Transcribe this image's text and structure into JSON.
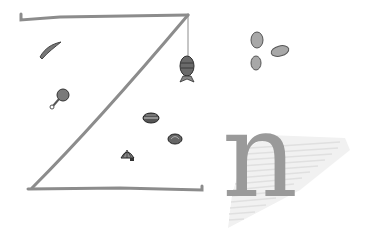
{
  "illustration": {
    "letters": [
      {
        "char": "Z",
        "style": "hand-drawn outline strokes",
        "color": "#8c8c8c"
      },
      {
        "char": "n",
        "style": "serif glyph with hatched shadow",
        "color": "#9a9a9a"
      }
    ],
    "n_glyph": "n",
    "shadow_color": "#e2e2e2",
    "icons": [
      {
        "name": "fish-on-line-icon",
        "x": 186,
        "y": 68
      },
      {
        "name": "chili-pepper-icon",
        "x": 48,
        "y": 50
      },
      {
        "name": "drumstick-icon",
        "x": 60,
        "y": 97
      },
      {
        "name": "shell-pile-icon",
        "x": 150,
        "y": 117
      },
      {
        "name": "shell-icon",
        "x": 174,
        "y": 138
      },
      {
        "name": "scallop-shell-icon",
        "x": 127,
        "y": 156
      },
      {
        "name": "egg-icon-1",
        "x": 257,
        "y": 40
      },
      {
        "name": "egg-icon-2",
        "x": 279,
        "y": 51
      },
      {
        "name": "egg-icon-3",
        "x": 255,
        "y": 63
      }
    ],
    "colors": {
      "stroke": "#8c8c8c",
      "icon_fill": "#7a7a7a",
      "icon_dark": "#3a3a3a",
      "egg_fill": "#a8a8a8"
    }
  }
}
